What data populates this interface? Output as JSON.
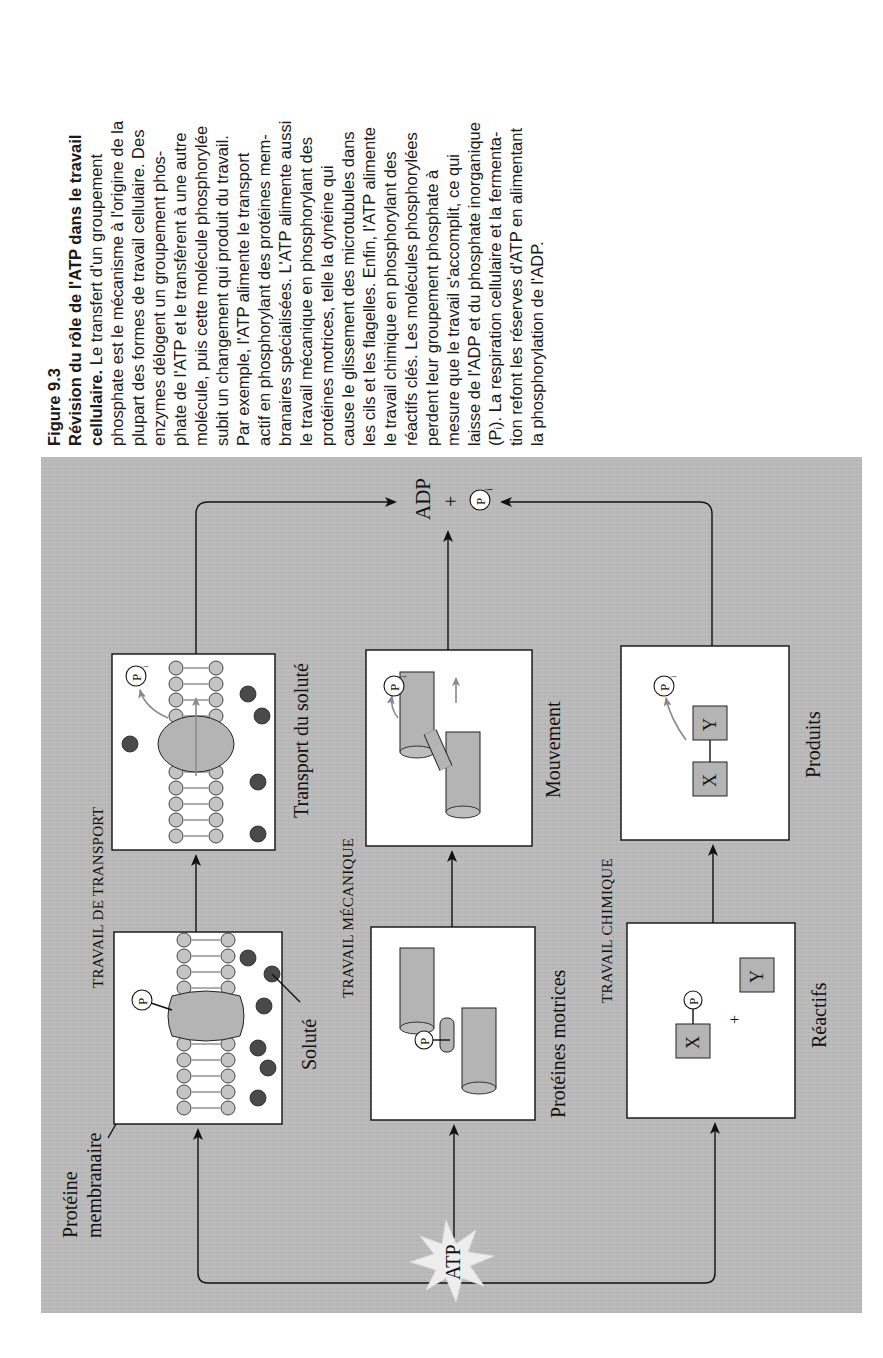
{
  "caption": {
    "figure_label": "Figure 9.3",
    "title_lines": [
      "Révision du rôle de l'ATP dans le travail",
      "cellulaire."
    ],
    "body_lines": [
      " Le transfert d'un groupement",
      "phosphate est le mécanisme à l'origine de la",
      "plupart des formes de travail cellulaire. Des",
      "enzymes délogent un groupement phos-",
      "phate de l'ATP et le transfèrent à une autre",
      "molécule, puis cette molécule phosphorylée",
      "subit un changement qui produit du travail.",
      "Par exemple, l'ATP alimente le transport",
      "actif en phosphorylant des protéines mem-",
      "branaires spécialisées. L'ATP alimente aussi",
      "le travail mécanique en phosphorylant des",
      "protéines motrices, telle la dynéine qui",
      "cause le glissement des microtubules dans",
      "les cils et les flagelles. Enfin, l'ATP alimente",
      "le travail chimique en phosphorylant des",
      "réactifs clés. Les molécules phosphorylées",
      "perdent leur groupement phosphate à",
      "mesure que le travail s'accomplit, ce qui",
      "laisse de l'ADP et du phosphate inorganique",
      "(Pᵢ). La respiration cellulaire et la fermenta-",
      "tion refont les réserves d'ATP en alimentant",
      "la phosphorylation de l'ADP."
    ]
  },
  "diagram": {
    "source": "ATP",
    "product_adp": "ADP",
    "plus": "+",
    "product_pi": "P",
    "pi_subscript": "i",
    "p_label": "P",
    "sections": {
      "transport": "TRAVAIL DE TRANSPORT",
      "mechanical": "TRAVAIL MÉCANIQUE",
      "chemical": "TRAVAIL CHIMIQUE"
    },
    "labels": {
      "membrane_protein_line1": "Protéine",
      "membrane_protein_line2": "membranaire",
      "solute": "Soluté",
      "solute_transport": "Transport du soluté",
      "motor_proteins": "Protéines motrices",
      "movement": "Mouvement",
      "reactants": "Réactifs",
      "products": "Produits",
      "x": "X",
      "y": "Y"
    },
    "colors": {
      "panel": "#b9b9b9",
      "box": "#ffffff",
      "protein": "#b4b4b4",
      "solute": "#4a4a4a",
      "star": "#ededed"
    }
  }
}
